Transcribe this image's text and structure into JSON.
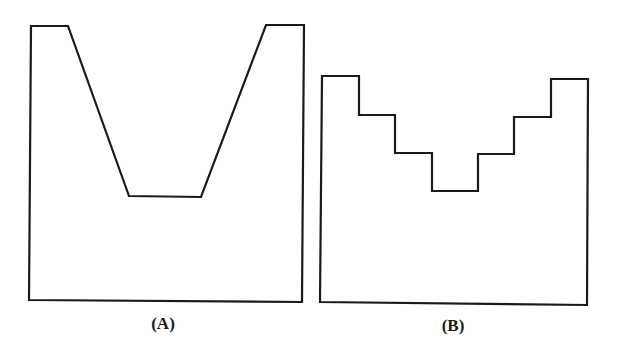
{
  "figure": {
    "panels": [
      {
        "id": "A",
        "label": "(A)",
        "description": "Container outline with a trapezoidal V-shaped notch cut into the top edge",
        "shape": "trapezoid-notch",
        "points": [
          [
            31,
            26
          ],
          [
            68,
            26
          ],
          [
            129,
            196
          ],
          [
            201,
            197
          ],
          [
            266,
            25
          ],
          [
            304,
            25
          ],
          [
            302,
            302
          ],
          [
            29,
            300
          ]
        ]
      },
      {
        "id": "B",
        "label": "(B)",
        "description": "Container outline with a stepped (staircase) notch cut into the top edge",
        "shape": "stepped-notch",
        "points": [
          [
            322,
            76
          ],
          [
            359,
            76
          ],
          [
            359,
            115
          ],
          [
            395,
            115
          ],
          [
            395,
            153
          ],
          [
            432,
            153
          ],
          [
            432,
            191
          ],
          [
            478,
            191
          ],
          [
            478,
            154
          ],
          [
            514,
            154
          ],
          [
            514,
            117
          ],
          [
            551,
            117
          ],
          [
            551,
            79
          ],
          [
            588,
            79
          ],
          [
            587,
            305
          ],
          [
            320,
            302
          ]
        ]
      }
    ],
    "colors": {
      "stroke": "#1a1a1a",
      "background": "#ffffff"
    }
  }
}
